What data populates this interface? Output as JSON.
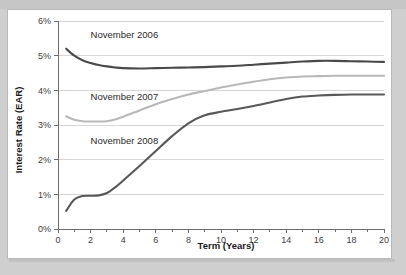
{
  "figure": {
    "background_color": "#ffffff",
    "page_background_color": "#cfcfcf",
    "border_color": "#b9b9b9"
  },
  "chart_data": {
    "type": "line",
    "title": "",
    "xlabel": "Term (Years)",
    "ylabel": "Interest Rate (EAR)",
    "xlim": [
      0,
      20
    ],
    "ylim": [
      0,
      6
    ],
    "grid": true,
    "legend_position": "inline-annotations",
    "xtick_labels": [
      "0",
      "2",
      "4",
      "6",
      "8",
      "10",
      "12",
      "14",
      "16",
      "18",
      "20"
    ],
    "xticks": [
      0,
      2,
      4,
      6,
      8,
      10,
      12,
      14,
      16,
      18,
      20
    ],
    "xminor_ticks": [
      1,
      3,
      5,
      7,
      9,
      11,
      13,
      15,
      17,
      19
    ],
    "ytick_labels": [
      "0%",
      "1%",
      "2%",
      "3%",
      "4%",
      "5%",
      "6%"
    ],
    "yticks": [
      0,
      1,
      2,
      3,
      4,
      5,
      6
    ],
    "y_unit": "%",
    "series": [
      {
        "name": "November 2006",
        "color": "#4a4a4a",
        "label_x": 2.0,
        "label_y": 5.52,
        "x": [
          0.5,
          1,
          1.5,
          2,
          2.5,
          3,
          3.5,
          4,
          5,
          6,
          7,
          8,
          9,
          10,
          11,
          12,
          13,
          14,
          15,
          16,
          17,
          18,
          19,
          20
        ],
        "values": [
          5.2,
          5.0,
          4.87,
          4.79,
          4.73,
          4.69,
          4.66,
          4.64,
          4.63,
          4.64,
          4.65,
          4.66,
          4.67,
          4.69,
          4.71,
          4.74,
          4.77,
          4.8,
          4.83,
          4.85,
          4.85,
          4.84,
          4.83,
          4.82
        ]
      },
      {
        "name": "November 2007",
        "color": "#b8b8b8",
        "label_x": 2.0,
        "label_y": 3.72,
        "x": [
          0.5,
          1,
          1.5,
          2,
          2.5,
          3,
          3.5,
          4,
          5,
          6,
          7,
          8,
          9,
          10,
          11,
          12,
          13,
          14,
          15,
          16,
          17,
          18,
          19,
          20
        ],
        "values": [
          3.25,
          3.15,
          3.11,
          3.1,
          3.1,
          3.11,
          3.16,
          3.24,
          3.42,
          3.6,
          3.75,
          3.88,
          3.98,
          4.08,
          4.17,
          4.25,
          4.32,
          4.37,
          4.4,
          4.41,
          4.42,
          4.42,
          4.42,
          4.42
        ]
      },
      {
        "name": "November 2008",
        "color": "#585858",
        "label_x": 2.0,
        "label_y": 2.45,
        "x": [
          0.5,
          1,
          1.5,
          2,
          2.5,
          3,
          3.5,
          4,
          5,
          6,
          7,
          8,
          9,
          10,
          11,
          12,
          13,
          14,
          15,
          16,
          17,
          18,
          19,
          20
        ],
        "values": [
          0.52,
          0.85,
          0.95,
          0.96,
          0.97,
          1.04,
          1.2,
          1.4,
          1.82,
          2.25,
          2.68,
          3.05,
          3.28,
          3.38,
          3.46,
          3.55,
          3.65,
          3.75,
          3.82,
          3.85,
          3.87,
          3.88,
          3.88,
          3.88
        ]
      }
    ]
  }
}
